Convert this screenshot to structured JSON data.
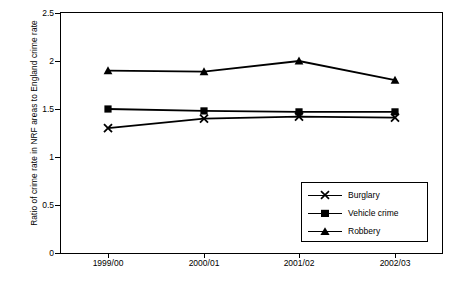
{
  "chart_data": {
    "type": "line",
    "title": "",
    "xlabel": "",
    "ylabel": "Ratio of crime rate in NRF areas to England crime rate",
    "categories": [
      "1999/00",
      "2000/01",
      "2001/02",
      "2002/03"
    ],
    "ylim": [
      0,
      2.5
    ],
    "yticks": [
      0,
      0.5,
      1,
      1.5,
      2,
      2.5
    ],
    "ytick_labels": [
      "0",
      "0.5",
      "1",
      "1.5",
      "2",
      "2.5"
    ],
    "grid": false,
    "legend_position": "bottom-right",
    "series": [
      {
        "name": "Burglary",
        "marker": "cross",
        "color": "#000000",
        "values": [
          1.3,
          1.4,
          1.42,
          1.41
        ]
      },
      {
        "name": "Vehicle crime",
        "marker": "square",
        "color": "#000000",
        "values": [
          1.5,
          1.48,
          1.47,
          1.47
        ]
      },
      {
        "name": "Robbery",
        "marker": "triangle",
        "color": "#000000",
        "values": [
          1.9,
          1.89,
          2.0,
          1.8
        ]
      }
    ]
  }
}
